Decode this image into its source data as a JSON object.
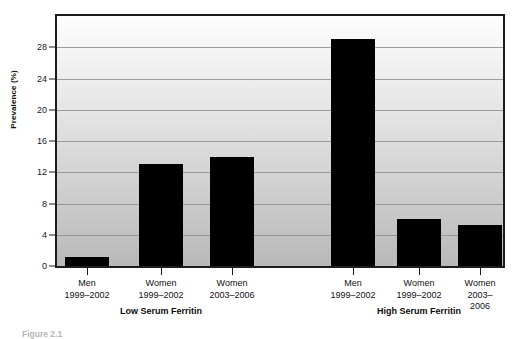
{
  "chart_data": {
    "type": "bar",
    "title": "",
    "subtitle": "",
    "xlabel": "",
    "ylabel": "Prevalence (%)",
    "ylim": [
      0,
      32
    ],
    "yticks": [
      0,
      4,
      8,
      12,
      16,
      20,
      24,
      28
    ],
    "ytick_labels": [
      "0",
      "4",
      "8",
      "12",
      "16",
      "20",
      "24",
      "28"
    ],
    "grid": true,
    "legend": "none",
    "categories": [
      "Men 1999–2002",
      "Women 1999–2002",
      "Women 2003–2006",
      "Men 1999–2002",
      "Women 1999–2002",
      "Women 2003–2006"
    ],
    "values": [
      1.1,
      13.0,
      14.0,
      29.0,
      6.0,
      5.3
    ],
    "bar_color": "#000000",
    "groups": [
      {
        "label": "Low Serum Ferritin",
        "bars": [
          {
            "sex": "Men",
            "years": "1999–2002",
            "value": 1.1
          },
          {
            "sex": "Women",
            "years": "1999–2002",
            "value": 13.0
          },
          {
            "sex": "Women",
            "years": "2003–2006",
            "value": 14.0
          }
        ]
      },
      {
        "label": "High Serum Ferritin",
        "bars": [
          {
            "sex": "Men",
            "years": "1999–2002",
            "value": 29.0
          },
          {
            "sex": "Women",
            "years": "1999–2002",
            "value": 6.0
          },
          {
            "sex": "Women",
            "years": "2003–2006",
            "value": 5.3
          }
        ]
      }
    ]
  },
  "caption": {
    "text": "Figure 2.1"
  }
}
